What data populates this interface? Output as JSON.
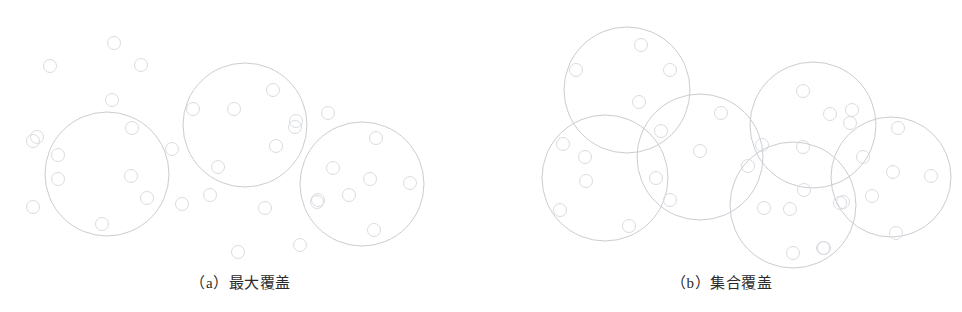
{
  "figure": {
    "background_color": "#ffffff",
    "big_circle_stroke": "#c9ccd1",
    "dot_stroke": "#d9dce0",
    "big_circle_stroke_width": 1,
    "dot_stroke_width": 1,
    "dot_radius": 6.5,
    "caption_color": "#2b2b2b"
  },
  "panels": [
    {
      "id": "panel-a",
      "caption_index": "（a）",
      "caption_text": "最大覆盖",
      "caption_full": "（a）最大覆盖",
      "coverage_circles": [
        {
          "cx": 107,
          "cy": 174,
          "r": 62
        },
        {
          "cx": 245,
          "cy": 125,
          "r": 62
        },
        {
          "cx": 362,
          "cy": 184,
          "r": 62
        }
      ],
      "points": [
        {
          "cx": 114,
          "cy": 43
        },
        {
          "cx": 50,
          "cy": 66
        },
        {
          "cx": 141,
          "cy": 65
        },
        {
          "cx": 112,
          "cy": 100
        },
        {
          "cx": 132,
          "cy": 128
        },
        {
          "cx": 37,
          "cy": 137
        },
        {
          "cx": 33,
          "cy": 141
        },
        {
          "cx": 58,
          "cy": 155
        },
        {
          "cx": 58,
          "cy": 179
        },
        {
          "cx": 131,
          "cy": 176
        },
        {
          "cx": 147,
          "cy": 198
        },
        {
          "cx": 33,
          "cy": 207
        },
        {
          "cx": 102,
          "cy": 224
        },
        {
          "cx": 172,
          "cy": 149
        },
        {
          "cx": 193,
          "cy": 109
        },
        {
          "cx": 234,
          "cy": 109
        },
        {
          "cx": 273,
          "cy": 90
        },
        {
          "cx": 296,
          "cy": 121
        },
        {
          "cx": 276,
          "cy": 146
        },
        {
          "cx": 218,
          "cy": 167
        },
        {
          "cx": 210,
          "cy": 195
        },
        {
          "cx": 182,
          "cy": 204
        },
        {
          "cx": 265,
          "cy": 208
        },
        {
          "cx": 317,
          "cy": 202
        },
        {
          "cx": 238,
          "cy": 252
        },
        {
          "cx": 300,
          "cy": 245
        },
        {
          "cx": 328,
          "cy": 113
        },
        {
          "cx": 295,
          "cy": 127
        },
        {
          "cx": 376,
          "cy": 138
        },
        {
          "cx": 333,
          "cy": 168
        },
        {
          "cx": 370,
          "cy": 179
        },
        {
          "cx": 410,
          "cy": 183
        },
        {
          "cx": 349,
          "cy": 195
        },
        {
          "cx": 318,
          "cy": 200
        },
        {
          "cx": 374,
          "cy": 230
        }
      ]
    },
    {
      "id": "panel-b",
      "caption_index": "（b）",
      "caption_text": "集合覆盖",
      "caption_full": "（b）集合覆盖",
      "coverage_circles": [
        {
          "cx": 627,
          "cy": 90,
          "r": 63
        },
        {
          "cx": 605,
          "cy": 178,
          "r": 63
        },
        {
          "cx": 700,
          "cy": 157,
          "r": 63
        },
        {
          "cx": 813,
          "cy": 125,
          "r": 63
        },
        {
          "cx": 793,
          "cy": 205,
          "r": 63
        },
        {
          "cx": 891,
          "cy": 177,
          "r": 60
        }
      ],
      "points": [
        {
          "cx": 641,
          "cy": 45
        },
        {
          "cx": 576,
          "cy": 70
        },
        {
          "cx": 670,
          "cy": 70
        },
        {
          "cx": 639,
          "cy": 102
        },
        {
          "cx": 661,
          "cy": 131
        },
        {
          "cx": 563,
          "cy": 144
        },
        {
          "cx": 585,
          "cy": 157
        },
        {
          "cx": 586,
          "cy": 181
        },
        {
          "cx": 656,
          "cy": 178
        },
        {
          "cx": 670,
          "cy": 200
        },
        {
          "cx": 560,
          "cy": 210
        },
        {
          "cx": 629,
          "cy": 226
        },
        {
          "cx": 721,
          "cy": 113
        },
        {
          "cx": 700,
          "cy": 151
        },
        {
          "cx": 748,
          "cy": 166
        },
        {
          "cx": 764,
          "cy": 208
        },
        {
          "cx": 762,
          "cy": 145
        },
        {
          "cx": 803,
          "cy": 91
        },
        {
          "cx": 850,
          "cy": 123
        },
        {
          "cx": 852,
          "cy": 110
        },
        {
          "cx": 803,
          "cy": 147
        },
        {
          "cx": 804,
          "cy": 190
        },
        {
          "cx": 790,
          "cy": 209
        },
        {
          "cx": 843,
          "cy": 202
        },
        {
          "cx": 793,
          "cy": 253
        },
        {
          "cx": 824,
          "cy": 248
        },
        {
          "cx": 830,
          "cy": 114
        },
        {
          "cx": 898,
          "cy": 128
        },
        {
          "cx": 863,
          "cy": 157
        },
        {
          "cx": 893,
          "cy": 172
        },
        {
          "cx": 931,
          "cy": 176
        },
        {
          "cx": 872,
          "cy": 196
        },
        {
          "cx": 840,
          "cy": 203
        },
        {
          "cx": 896,
          "cy": 233
        },
        {
          "cx": 823,
          "cy": 248
        }
      ]
    }
  ],
  "chart_data": {
    "type": "scatter",
    "title": "",
    "subtitle": "",
    "xlabel": "",
    "ylabel": "",
    "grid": false,
    "legend_position": "none",
    "series": [
      {
        "name": "（a）最大覆盖 disks",
        "count": 3
      },
      {
        "name": "（a）最大覆盖 points",
        "count": 35
      },
      {
        "name": "（b）集合覆盖 disks",
        "count": 6
      },
      {
        "name": "（b）集合覆盖 points",
        "count": 35
      }
    ]
  }
}
